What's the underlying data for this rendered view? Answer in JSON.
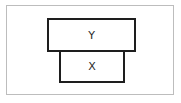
{
  "diagram": {
    "type": "stacked-boxes",
    "boxes": [
      {
        "id": "top",
        "label": "Y"
      },
      {
        "id": "bottom",
        "label": "X"
      }
    ],
    "relation": "Y stacked on top of X"
  },
  "colors": {
    "background": "#ffffff",
    "frame_border": "#bdbdbd",
    "box_border": "#1e1e1e",
    "text": "#2a2a2a"
  }
}
